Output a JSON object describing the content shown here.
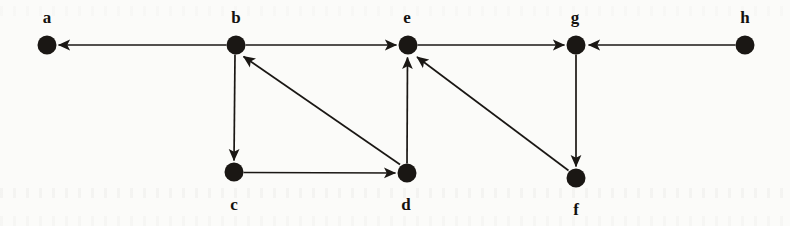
{
  "figure": {
    "type": "directed-graph",
    "background_color": "#fbfbf9",
    "ink_color": "#1a1714",
    "node_radius": 9.5,
    "nodes": [
      {
        "id": "a",
        "label": "a",
        "x": 47,
        "y": 45,
        "label_x": 47,
        "label_y": 9
      },
      {
        "id": "b",
        "label": "b",
        "x": 236,
        "y": 45,
        "label_x": 236,
        "label_y": 9
      },
      {
        "id": "e",
        "label": "e",
        "x": 408,
        "y": 45,
        "label_x": 407,
        "label_y": 9
      },
      {
        "id": "g",
        "label": "g",
        "x": 576,
        "y": 45,
        "label_x": 575,
        "label_y": 9
      },
      {
        "id": "h",
        "label": "h",
        "x": 745,
        "y": 45,
        "label_x": 745,
        "label_y": 9
      },
      {
        "id": "c",
        "label": "c",
        "x": 234,
        "y": 172,
        "label_x": 234,
        "label_y": 196
      },
      {
        "id": "d",
        "label": "d",
        "x": 407,
        "y": 173,
        "label_x": 406,
        "label_y": 196
      },
      {
        "id": "f",
        "label": "f",
        "x": 576,
        "y": 178,
        "label_x": 576,
        "label_y": 201
      }
    ],
    "edges": [
      {
        "from": "b",
        "to": "a",
        "direction": "left",
        "arrow_at": "a"
      },
      {
        "from": "b",
        "to": "e",
        "direction": "right",
        "arrow_at": "e"
      },
      {
        "from": "e",
        "to": "g",
        "direction": "right",
        "arrow_at": "g"
      },
      {
        "from": "h",
        "to": "g",
        "direction": "left",
        "arrow_at": "g"
      },
      {
        "from": "b",
        "to": "c",
        "direction": "down",
        "arrow_at": "c"
      },
      {
        "from": "c",
        "to": "d",
        "direction": "right",
        "arrow_at": "d"
      },
      {
        "from": "d",
        "to": "b",
        "direction": "up-left",
        "arrow_at": "b"
      },
      {
        "from": "d",
        "to": "e",
        "direction": "up",
        "arrow_at": "e"
      },
      {
        "from": "g",
        "to": "f",
        "direction": "down",
        "arrow_at": "f"
      },
      {
        "from": "f",
        "to": "e",
        "direction": "up-left",
        "arrow_at": "e"
      }
    ]
  }
}
